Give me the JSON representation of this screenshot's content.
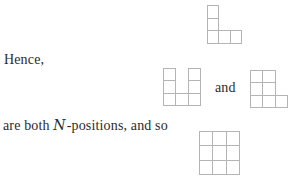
{
  "page": {
    "background": "#ffffff",
    "text_color": "#2b2b2b",
    "grid_line_color": "#b4b4b4",
    "cell_fill": "#ffffff"
  },
  "text": {
    "hence": "Hence,",
    "and": "and",
    "bottom_prefix": "are both ",
    "script_n": "N",
    "bottom_suffix": "-positions, and so"
  },
  "shapes": [
    {
      "name": "polyomino-top-l-pentomino",
      "x": 207,
      "y": 5,
      "cell_w": 11.3,
      "cell_h": 12.6,
      "rows": [
        [
          1,
          0,
          0
        ],
        [
          1,
          0,
          0
        ],
        [
          1,
          1,
          1
        ]
      ]
    },
    {
      "name": "polyomino-middle-u-heptomino",
      "x": 163,
      "y": 68,
      "cell_w": 12.3,
      "cell_h": 12.3,
      "rows": [
        [
          1,
          0,
          1
        ],
        [
          1,
          0,
          1
        ],
        [
          1,
          1,
          1
        ]
      ]
    },
    {
      "name": "polyomino-right-p-heptomino",
      "x": 250,
      "y": 70,
      "cell_w": 12.3,
      "cell_h": 12.3,
      "rows": [
        [
          1,
          1,
          0
        ],
        [
          1,
          1,
          0
        ],
        [
          1,
          1,
          1
        ]
      ]
    },
    {
      "name": "polyomino-bottom-full-3x3-grid",
      "x": 199,
      "y": 131,
      "cell_w": 13.3,
      "cell_h": 14.3,
      "rows": [
        [
          1,
          1,
          1
        ],
        [
          1,
          1,
          1
        ],
        [
          1,
          1,
          1
        ]
      ]
    }
  ]
}
